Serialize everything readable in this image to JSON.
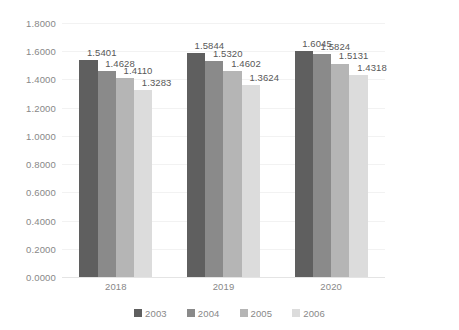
{
  "chart_data": {
    "type": "bar",
    "title": "",
    "subtitle": "",
    "xlabel": "",
    "ylabel": "",
    "categories": [
      "2018",
      "2019",
      "2020"
    ],
    "series": [
      {
        "name": "2003",
        "color": "#5f5f5f",
        "values": [
          1.5401,
          1.5844,
          1.6045
        ]
      },
      {
        "name": "2004",
        "color": "#8a8a8a",
        "values": [
          1.4628,
          1.532,
          1.5824
        ]
      },
      {
        "name": "2005",
        "color": "#b5b5b5",
        "values": [
          1.411,
          1.4602,
          1.5131
        ]
      },
      {
        "name": "2006",
        "color": "#dcdcdc",
        "values": [
          1.3283,
          1.3624,
          1.4318
        ]
      }
    ],
    "data_labels": [
      [
        "1.5401",
        "1.4628",
        "1.4110",
        "1.3283"
      ],
      [
        "1.5844",
        "1.5320",
        "1.4602",
        "1.3624"
      ],
      [
        "1.6045",
        "1.5824",
        "1.5131",
        "1.4318"
      ]
    ],
    "ylim": [
      0.0,
      1.8
    ],
    "ytick_labels": [
      "1.8000",
      "1.6000",
      "1.4000",
      "1.2000",
      "1.0000",
      "0.8000",
      "0.6000",
      "0.4000",
      "0.2000",
      "0.0000"
    ],
    "ytick_values": [
      1.8,
      1.6,
      1.4,
      1.2,
      1.0,
      0.8,
      0.6,
      0.4,
      0.2,
      0.0
    ],
    "grid": true,
    "grid_color": "#f2f2f2",
    "legend_position": "bottom",
    "background": "#ffffff",
    "axis_text_color": "#888888",
    "label_text_color": "#585858"
  }
}
